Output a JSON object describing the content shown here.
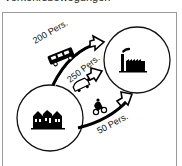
{
  "caption": "Verkehrsbewegungen",
  "diagram": {
    "nodes": [
      {
        "id": "residential",
        "icon": "houses-icon",
        "label": "Wohngebiet"
      },
      {
        "id": "workplace",
        "icon": "factory-icon",
        "label": "Arbeitsstätte"
      }
    ],
    "flows": [
      {
        "mode": "car",
        "icon": "car-icon",
        "label": "200 Pers."
      },
      {
        "mode": "bus",
        "icon": "bus-icon",
        "label": "250 Pers."
      },
      {
        "mode": "bicycle",
        "icon": "bicycle-icon",
        "label": "50 Pers."
      }
    ]
  }
}
